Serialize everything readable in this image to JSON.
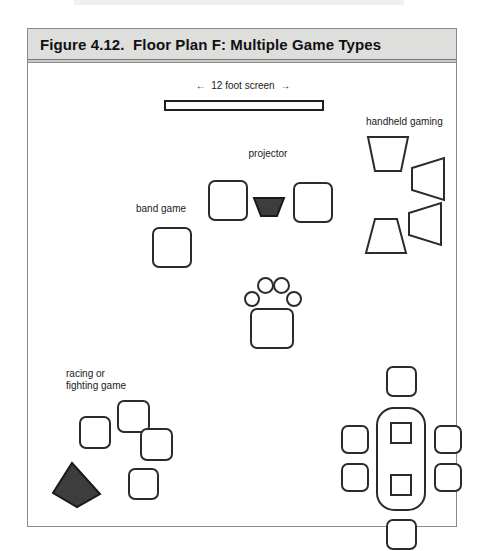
{
  "figure": {
    "title": "Figure 4.12.  Floor Plan F: Multiple Game Types",
    "caption_number": "4.12",
    "caption_name": "Floor Plan F: Multiple Game Types"
  },
  "plan": {
    "labels": {
      "screen": "←  12 foot screen  →",
      "projector": "projector",
      "band_game": "band game",
      "handheld_gaming": "handheld gaming",
      "racing_fighting_game": "racing or\nfighting game"
    },
    "legend_notes": {
      "screen_width": "12 foot",
      "zones": [
        "12 foot screen",
        "projector",
        "band game",
        "handheld gaming",
        "racing or fighting game"
      ]
    },
    "counts": {
      "band_game_seats": 3,
      "band_game_drum_circles": 4,
      "handheld_gaming_seats": 4,
      "racing_fighting_seats": 4,
      "racing_fighting_filled_shapes": 1,
      "table_seats": 6,
      "table_squares": 2
    }
  },
  "colors": {
    "header_band": "#dededc",
    "frame_border": "#8b8b8b",
    "shape_outline": "#2b2b2b",
    "filled_shape": "#3d3d3d",
    "page_background": "#ffffff"
  }
}
